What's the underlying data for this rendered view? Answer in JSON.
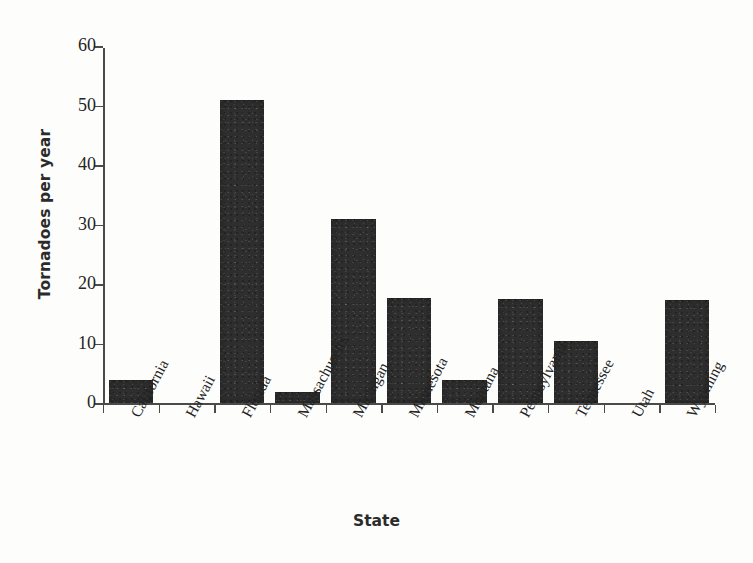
{
  "chart_data": {
    "type": "bar",
    "title": "",
    "subtitle": "",
    "xlabel": "State",
    "ylabel": "Tornadoes per year",
    "categories": [
      "California",
      "Hawaii",
      "Florida",
      "Massachusetts",
      "Michigan",
      "Minnesota",
      "Montana",
      "Pennsylvania",
      "Tennessee",
      "Utah",
      "Wyoming"
    ],
    "values": [
      4,
      0,
      51,
      2,
      31,
      17.8,
      4,
      17.5,
      10.5,
      0,
      17.3
    ],
    "ylim": [
      0,
      60
    ],
    "yticks": [
      0,
      10,
      20,
      30,
      40,
      50,
      60
    ],
    "ytick_labels": [
      "0",
      "10",
      "20",
      "30",
      "40",
      "50",
      "60"
    ],
    "grid": false,
    "legend": null,
    "bar_color": "#2e2e2e",
    "background_color": "#fdfdfb",
    "axis_color": "#4a4a4a",
    "xtick_label_rotation": -62
  }
}
